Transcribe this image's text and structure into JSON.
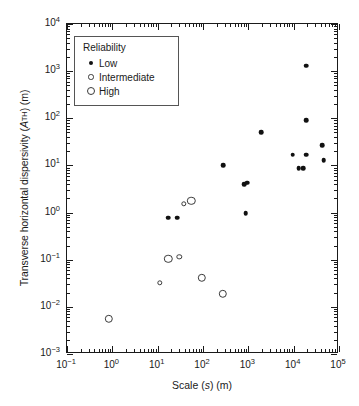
{
  "chart_data": {
    "type": "scatter",
    "title": "",
    "xlabel": "Scale (s) (m)",
    "ylabel": "Transverse horizontal dispersivity (ATH) (m)",
    "xlabel_parts": {
      "pre": "Scale (",
      "ital": "s",
      "post": ") (m)"
    },
    "ylabel_parts": {
      "pre": "Transverse horizontal dispersivity (",
      "ital": "A",
      "sub": "TH",
      "post": ") (m)"
    },
    "xscale": "log",
    "yscale": "log",
    "xlim": [
      0.1,
      100000
    ],
    "ylim": [
      0.001,
      10000
    ],
    "grid": false,
    "xticks": [
      0.1,
      1,
      10,
      100,
      1000,
      10000,
      100000
    ],
    "xticklabels": [
      "10-1",
      "100",
      "101",
      "102",
      "103",
      "104",
      "105"
    ],
    "xtick_exponents": [
      "-1",
      "0",
      "1",
      "2",
      "3",
      "4",
      "5"
    ],
    "yticks": [
      0.001,
      0.01,
      0.1,
      1,
      10,
      100,
      1000,
      10000
    ],
    "yticklabels": [
      "10-3",
      "10-2",
      "10-1",
      "100",
      "101",
      "102",
      "103",
      "104"
    ],
    "ytick_exponents": [
      "-3",
      "-2",
      "-1",
      "0",
      "1",
      "2",
      "3",
      "4"
    ],
    "tick_mantissa": "10",
    "legend": {
      "position": "upper left",
      "title": "Reliability",
      "entries": [
        {
          "label": "Low",
          "marker": "filled-circle-small",
          "key": "low"
        },
        {
          "label": "Intermediate",
          "marker": "open-circle-small",
          "key": "intermediate"
        },
        {
          "label": "High",
          "marker": "open-circle-large",
          "key": "high"
        }
      ]
    },
    "series": [
      {
        "name": "Low",
        "key": "low",
        "marker": "filled-circle-small",
        "color": "#111111",
        "points": [
          {
            "x": 17,
            "y": 0.78
          },
          {
            "x": 27,
            "y": 0.78
          },
          {
            "x": 280,
            "y": 10
          },
          {
            "x": 800,
            "y": 4.0
          },
          {
            "x": 950,
            "y": 4.3
          },
          {
            "x": 880,
            "y": 0.98
          },
          {
            "x": 1900,
            "y": 50
          },
          {
            "x": 9500,
            "y": 17
          },
          {
            "x": 13000,
            "y": 8.7
          },
          {
            "x": 16000,
            "y": 8.7
          },
          {
            "x": 19000,
            "y": 17
          },
          {
            "x": 19000,
            "y": 90
          },
          {
            "x": 19000,
            "y": 1300
          },
          {
            "x": 42000,
            "y": 27
          },
          {
            "x": 46000,
            "y": 13
          }
        ]
      },
      {
        "name": "Intermediate",
        "key": "intermediate",
        "marker": "open-circle-small",
        "color": "#3a3a3a",
        "points": [
          {
            "x": 11,
            "y": 0.032
          },
          {
            "x": 30,
            "y": 0.115
          },
          {
            "x": 38,
            "y": 1.55
          }
        ]
      },
      {
        "name": "High",
        "key": "high",
        "marker": "open-circle-large",
        "color": "#3a3a3a",
        "points": [
          {
            "x": 0.83,
            "y": 0.0055
          },
          {
            "x": 17,
            "y": 0.105
          },
          {
            "x": 55,
            "y": 1.8
          },
          {
            "x": 95,
            "y": 0.041
          },
          {
            "x": 270,
            "y": 0.019
          }
        ]
      }
    ]
  }
}
